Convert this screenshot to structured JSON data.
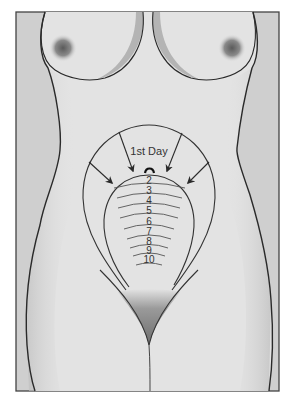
{
  "figure": {
    "first_label": "1st Day",
    "day_labels": [
      "2",
      "3",
      "4",
      "5",
      "6",
      "7",
      "8",
      "9",
      "10"
    ],
    "icons": {
      "arrow": "arrow-down-inward-icon",
      "curl": "curved-arrow-icon"
    },
    "colors": {
      "background": "#cfcfcf",
      "body": "#e3e3e3",
      "outline": "#2a2a2a",
      "line": "#555555",
      "shade": "#7a7a7a",
      "frame": "#444444"
    }
  }
}
